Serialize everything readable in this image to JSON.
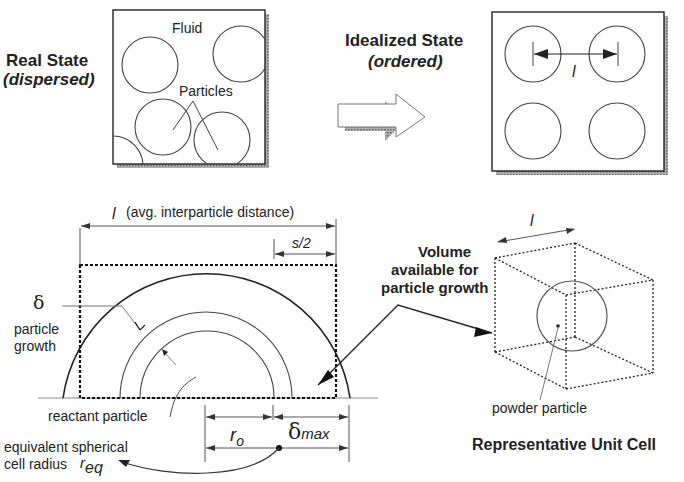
{
  "top": {
    "real_state": {
      "title": "Real State",
      "subtitle": "(dispersed)",
      "fluid_label": "Fluid",
      "particles_label": "Particles"
    },
    "idealized_state": {
      "title": "Idealized State",
      "subtitle": "(ordered)",
      "spacing_label": "l"
    },
    "transition_arrow": "right-arrow-icon"
  },
  "cross_section": {
    "interparticle_symbol": "l",
    "interparticle_label": "(avg. interparticle distance)",
    "half_gap_label": "s/2",
    "delta_symbol": "δ",
    "growth_label_line1": "particle",
    "growth_label_line2": "growth",
    "reactant_label": "reactant particle",
    "r0_symbol": "r",
    "r0_subscript": "o",
    "dmax_symbol": "δ",
    "dmax_subscript": "max",
    "req_label_line1": "equivalent spherical",
    "req_label_line2": "cell radius",
    "req_symbol": "r",
    "req_subscript": "eq"
  },
  "volume_label": {
    "line1": "Volume",
    "line2": "available for",
    "line3": "particle growth"
  },
  "unit_cell": {
    "edge_symbol": "l",
    "particle_label": "powder particle",
    "title": "Representative Unit Cell"
  },
  "colors": {
    "line": "#333333",
    "shadow": "#8a8a8a",
    "background": "#ffffff"
  }
}
